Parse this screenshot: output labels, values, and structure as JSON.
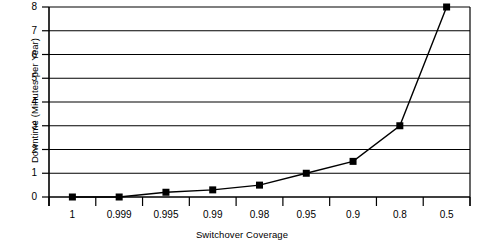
{
  "chart_data": {
    "type": "line",
    "title": "",
    "xlabel": "Switchover Coverage",
    "ylabel": "Downtime (Minutes per Year)",
    "categories": [
      "1",
      "0.999",
      "0.995",
      "0.99",
      "0.98",
      "0.95",
      "0.9",
      "0.8",
      "0.5"
    ],
    "values": [
      0.0,
      0.0,
      0.2,
      0.3,
      0.5,
      1.0,
      1.5,
      3.0,
      8.0
    ],
    "series": [
      {
        "name": "Downtime",
        "values": [
          0.0,
          0.0,
          0.2,
          0.3,
          0.5,
          1.0,
          1.5,
          3.0,
          8.0
        ]
      }
    ],
    "ylim": [
      0,
      8
    ],
    "yticks": [
      0,
      1,
      2,
      3,
      4,
      5,
      6,
      7,
      8
    ],
    "ytick_labels": [
      "0",
      "1",
      "2",
      "3",
      "4",
      "5",
      "6",
      "7",
      "8"
    ],
    "grid": "horizontal",
    "legend": "none",
    "marker": "square",
    "line_color": "#000000",
    "marker_color": "#000000",
    "grid_color": "#000000",
    "background": "#ffffff"
  }
}
